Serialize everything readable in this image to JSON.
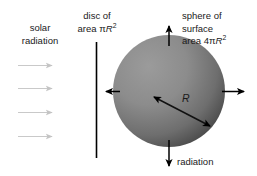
{
  "figure": {
    "type": "physics-diagram",
    "background_color": "#ffffff"
  },
  "labels": {
    "solar_radiation": {
      "line1": "solar",
      "line2": "radiation"
    },
    "disc_area": {
      "line1": "disc of",
      "line2_prefix": "area ",
      "line2_pi": "π",
      "line2_var": "R",
      "line2_exp": "2"
    },
    "sphere_area": {
      "line1": "sphere of",
      "line2": "surface",
      "line3_prefix": "area 4",
      "line3_pi": "π",
      "line3_var": "R",
      "line3_exp": "2"
    },
    "radiation_out": "radiation",
    "radius": "R"
  },
  "colors": {
    "sphere_light": "#929292",
    "sphere_dark": "#474747",
    "incoming_arrow": "#c9c9c9",
    "outgoing_arrow": "#000000",
    "disc_line": "#000000",
    "text": "#1a1a1a"
  },
  "geometry": {
    "sphere": {
      "cx": 169,
      "cy": 91,
      "r": 56
    },
    "disc_line": {
      "x": 96,
      "y_top": 42,
      "y_bottom": 158
    },
    "radius_arrow": {
      "x1": 151,
      "y1": 95,
      "x2": 213,
      "y2": 128
    }
  },
  "incoming_arrows": [
    {
      "name": "solar-ray-1",
      "x1": 18,
      "y1": 65,
      "x2": 57
    },
    {
      "name": "solar-ray-2",
      "x1": 18,
      "y1": 88,
      "x2": 57
    },
    {
      "name": "solar-ray-3",
      "x1": 18,
      "y1": 112,
      "x2": 57
    },
    {
      "name": "solar-ray-4",
      "x1": 18,
      "y1": 136,
      "x2": 57
    }
  ],
  "outgoing_arrows": [
    {
      "name": "emission-arrow-up",
      "direction": "up"
    },
    {
      "name": "emission-arrow-left",
      "direction": "left"
    },
    {
      "name": "emission-arrow-right",
      "direction": "right"
    },
    {
      "name": "emission-arrow-down",
      "direction": "down"
    }
  ]
}
